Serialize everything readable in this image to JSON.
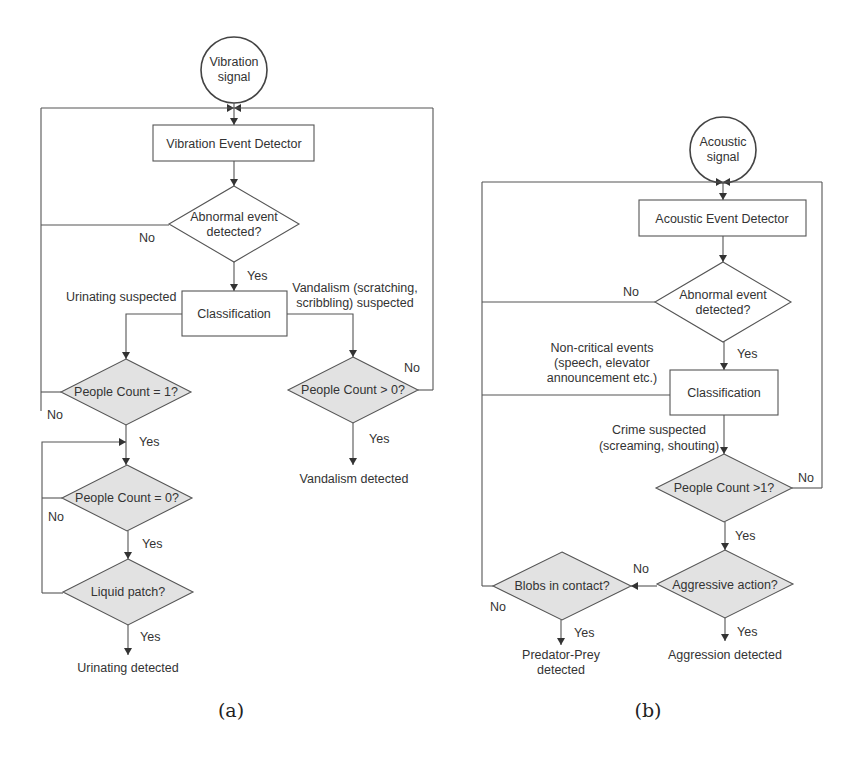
{
  "panel_a": {
    "caption": "(a)",
    "start": {
      "line1": "Vibration",
      "line2": "signal"
    },
    "detector": "Vibration Event Detector",
    "decision_abnormal": {
      "line1": "Abnormal event",
      "line2": "detected?"
    },
    "no_abnormal": "No",
    "yes_abnormal": "Yes",
    "classification": "Classification",
    "urinating_suspected": "Urinating suspected",
    "vandalism_suspected": {
      "line1": "Vandalism (scratching,",
      "line2": "scribbling) suspected"
    },
    "decision_pc1": "People Count = 1?",
    "pc1_no": "No",
    "pc1_yes": "Yes",
    "decision_pc_gt0": "People Count > 0?",
    "pcgt0_no": "No",
    "pcgt0_yes": "Yes",
    "vandalism_detected": "Vandalism detected",
    "decision_pc0": "People Count = 0?",
    "pc0_no": "No",
    "pc0_yes": "Yes",
    "decision_liquid": "Liquid patch?",
    "liquid_yes": "Yes",
    "urinating_detected": "Urinating detected"
  },
  "panel_b": {
    "caption": "(b)",
    "start": {
      "line1": "Acoustic",
      "line2": "signal"
    },
    "detector": "Acoustic Event Detector",
    "decision_abnormal": {
      "line1": "Abnormal event",
      "line2": "detected?"
    },
    "no_abnormal": "No",
    "yes_abnormal": "Yes",
    "non_critical": {
      "line1": "Non-critical events",
      "line2": "(speech, elevator",
      "line3": "announcement etc.)"
    },
    "classification": "Classification",
    "crime_suspected": {
      "line1": "Crime suspected",
      "line2": "(screaming, shouting)"
    },
    "decision_pc_gt1": "People Count >1?",
    "pcgt1_no": "No",
    "pcgt1_yes": "Yes",
    "decision_aggressive": "Aggressive action?",
    "aggressive_no": "No",
    "aggressive_yes": "Yes",
    "aggression_detected": "Aggression detected",
    "decision_blobs": "Blobs in contact?",
    "blobs_no": "No",
    "blobs_yes": "Yes",
    "predator_prey": {
      "line1": "Predator-Prey",
      "line2": "detected"
    }
  }
}
